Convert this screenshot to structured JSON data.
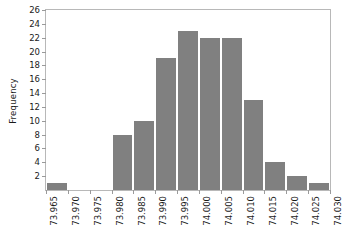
{
  "chart_data": {
    "type": "bar",
    "title": "",
    "subtitle": "",
    "xlabel": "",
    "ylabel": "Frequency",
    "grid": false,
    "legend": null,
    "xlim": [
      73.965,
      74.03
    ],
    "ylim": [
      0,
      26
    ],
    "bin_width": 0.005,
    "xticks": [
      "73.965",
      "73.970",
      "73.975",
      "73.980",
      "73.985",
      "73.990",
      "73.995",
      "74.000",
      "74.005",
      "74.010",
      "74.015",
      "74.020",
      "74.025",
      "74.030"
    ],
    "xtick_values": [
      73.965,
      73.97,
      73.975,
      73.98,
      73.985,
      73.99,
      73.995,
      74.0,
      74.005,
      74.01,
      74.015,
      74.02,
      74.025,
      74.03
    ],
    "yticks": [
      "2",
      "4",
      "6",
      "8",
      "10",
      "12",
      "14",
      "16",
      "18",
      "20",
      "22",
      "24",
      "26"
    ],
    "ytick_values": [
      2,
      4,
      6,
      8,
      10,
      12,
      14,
      16,
      18,
      20,
      22,
      24,
      26
    ],
    "categories": [
      "73.965",
      "73.970",
      "73.975",
      "73.980",
      "73.985",
      "73.990",
      "73.995",
      "74.000",
      "74.005",
      "74.010",
      "74.015",
      "74.020",
      "74.025"
    ],
    "bin_edges": [
      73.965,
      73.97,
      73.975,
      73.98,
      73.985,
      73.99,
      73.995,
      74.0,
      74.005,
      74.01,
      74.015,
      74.02,
      74.025,
      74.03
    ],
    "values": [
      1,
      0,
      0,
      8,
      10,
      19,
      23,
      22,
      22,
      13,
      4,
      2,
      1
    ],
    "bar_color": "#808080",
    "bar_edge_color": "#ffffff",
    "axis_color": "#b8b8b8",
    "text_color": "#1a1a1a",
    "background": "#ffffff"
  }
}
